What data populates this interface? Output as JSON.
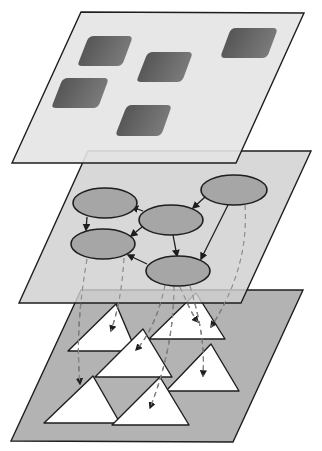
{
  "diagram": {
    "colors": {
      "top_plane": "#e4e4e4",
      "middle_plane": "#cfcfcf",
      "bottom_plane": "#b3b3b3",
      "node_fill": "#a6a6a6",
      "square_dark": "#4e4e4e",
      "square_light": "#7a7a7a",
      "triangle_fill": "#ffffff",
      "stroke": "#1e1e1e",
      "dashed": "#555555"
    },
    "layers": [
      {
        "name": "top",
        "corners": [
          [
            81,
            12
          ],
          [
            304,
            13
          ],
          [
            236,
            163
          ],
          [
            12,
            163
          ]
        ],
        "squares": [
          {
            "id": "sq1",
            "points": [
              [
                89,
                36
              ],
              [
                133,
                36
              ],
              [
                122,
                66
              ],
              [
                77,
                66
              ]
            ]
          },
          {
            "id": "sq2",
            "points": [
              [
                148,
                52
              ],
              [
                193,
                52
              ],
              [
                182,
                82
              ],
              [
                136,
                82
              ]
            ]
          },
          {
            "id": "sq3",
            "points": [
              [
                231,
                28
              ],
              [
                278,
                28
              ],
              [
                267,
                58
              ],
              [
                220,
                58
              ]
            ]
          },
          {
            "id": "sq4",
            "points": [
              [
                63,
                78
              ],
              [
                109,
                78
              ],
              [
                98,
                108
              ],
              [
                51,
                108
              ]
            ]
          },
          {
            "id": "sq5",
            "points": [
              [
                127,
                105
              ],
              [
                172,
                105
              ],
              [
                161,
                136
              ],
              [
                115,
                136
              ]
            ]
          }
        ]
      },
      {
        "name": "middle",
        "corners": [
          [
            88,
            151
          ],
          [
            311,
            151
          ],
          [
            241,
            303
          ],
          [
            19,
            303
          ]
        ],
        "nodes": [
          {
            "id": "n1",
            "cx": 105,
            "cy": 203,
            "rx": 32,
            "ry": 15
          },
          {
            "id": "n2",
            "cx": 103,
            "cy": 244,
            "rx": 32,
            "ry": 15
          },
          {
            "id": "n3",
            "cx": 171,
            "cy": 220,
            "rx": 32,
            "ry": 15
          },
          {
            "id": "n4",
            "cx": 234,
            "cy": 190,
            "rx": 33,
            "ry": 15
          },
          {
            "id": "n5",
            "cx": 178,
            "cy": 271,
            "rx": 32,
            "ry": 15
          }
        ],
        "edges": [
          {
            "from": "n1",
            "to": "n2",
            "path": [
              [
                87,
                217
              ],
              [
                86,
                230
              ]
            ]
          },
          {
            "from": "n3",
            "to": "n1",
            "path": [
              [
                143,
                211
              ],
              [
                132,
                207
              ]
            ]
          },
          {
            "from": "n3",
            "to": "n2",
            "path": [
              [
                142,
                227
              ],
              [
                131,
                236
              ]
            ]
          },
          {
            "from": "n4",
            "to": "n3",
            "path": [
              [
                205,
                197
              ],
              [
                193,
                208
              ]
            ]
          },
          {
            "from": "n3",
            "to": "n5",
            "path": [
              [
                173,
                235
              ],
              [
                177,
                256
              ]
            ]
          },
          {
            "from": "n4",
            "to": "n5",
            "path": [
              [
                228,
                205
              ],
              [
                201,
                259
              ]
            ]
          },
          {
            "from": "n5",
            "to": "n2",
            "path": [
              [
                147,
                264
              ],
              [
                128,
                255
              ]
            ]
          }
        ]
      },
      {
        "name": "bottom",
        "corners": [
          [
            81,
            290
          ],
          [
            303,
            290
          ],
          [
            233,
            442
          ],
          [
            11,
            441
          ]
        ],
        "triangles": [
          {
            "id": "t1",
            "points": [
              [
                116,
                304
              ],
              [
                136,
                351
              ],
              [
                68,
                351
              ]
            ]
          },
          {
            "id": "t2",
            "points": [
              [
                196,
                293
              ],
              [
                225,
                339
              ],
              [
                149,
                339
              ]
            ]
          },
          {
            "id": "t3",
            "points": [
              [
                143,
                329
              ],
              [
                172,
                377
              ],
              [
                95,
                377
              ]
            ]
          },
          {
            "id": "t4",
            "points": [
              [
                211,
                344
              ],
              [
                239,
                391
              ],
              [
                166,
                391
              ]
            ]
          },
          {
            "id": "t5",
            "points": [
              [
                93,
                376
              ],
              [
                120,
                423
              ],
              [
                44,
                423
              ]
            ]
          },
          {
            "id": "t6",
            "points": [
              [
                160,
                377
              ],
              [
                189,
                425
              ],
              [
                112,
                425
              ]
            ]
          }
        ]
      }
    ],
    "projections": [
      {
        "from": "n2",
        "to": "t5",
        "d": "M87,259 C80,300 76,340 80,384"
      },
      {
        "from": "n2",
        "to": "t1",
        "d": "M124,258 C122,290 118,310 111,331"
      },
      {
        "from": "n5",
        "to": "t3",
        "d": "M165,285 C160,310 150,335 136,350"
      },
      {
        "from": "n5",
        "to": "t6",
        "d": "M174,286 C174,330 165,370 150,408"
      },
      {
        "from": "n5",
        "to": "t4",
        "d": "M190,286 C200,320 205,345 203,376"
      },
      {
        "from": "n4",
        "to": "t2",
        "d": "M245,205 C248,250 235,290 211,327"
      },
      {
        "from": "n5",
        "to": "t2",
        "d": "M180,287 C186,300 192,315 198,322"
      }
    ]
  }
}
